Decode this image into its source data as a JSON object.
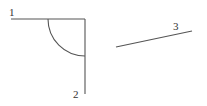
{
  "diagram": {
    "labels": {
      "line1": "1",
      "line2": "2",
      "line3": "3"
    },
    "colors": {
      "stroke": "#555555",
      "text": "#333333",
      "background": "#ffffff"
    },
    "elements": [
      {
        "id": "line1",
        "type": "line",
        "from": [
          11,
          19
        ],
        "to": [
          85,
          19
        ]
      },
      {
        "id": "line2",
        "type": "line",
        "from": [
          85,
          19
        ],
        "to": [
          85,
          94
        ]
      },
      {
        "id": "arc",
        "type": "arc",
        "center": [
          85,
          19
        ],
        "radius": 37,
        "from": [
          48,
          19
        ],
        "to": [
          85,
          56
        ]
      },
      {
        "id": "line3",
        "type": "line",
        "from": [
          116,
          47
        ],
        "to": [
          192,
          31
        ]
      }
    ]
  }
}
